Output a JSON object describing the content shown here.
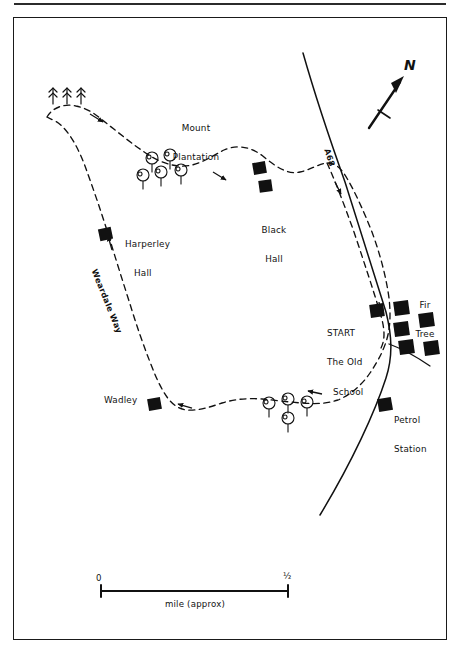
{
  "map": {
    "title": "Weardale Way walking route map",
    "orientation": {
      "label": "N",
      "name": "north-arrow"
    },
    "scale_bar": {
      "start_label": "0",
      "end_label": "½",
      "caption": "mile (approx)"
    },
    "roads": [
      {
        "id": "a68",
        "label": "A68",
        "type": "main-road"
      },
      {
        "id": "side-road",
        "label": "",
        "type": "minor-road"
      }
    ],
    "route": {
      "name": "Weardale Way",
      "path_label": "Weardale Way",
      "style": "dashed",
      "direction_markers": 6
    },
    "start_point": {
      "line1": "START",
      "line2": "The Old",
      "line3": "School"
    },
    "places": [
      {
        "id": "mount-plantation",
        "label_line1": "Mount",
        "label_line2": "Plantation",
        "kind": "woodland"
      },
      {
        "id": "black-hall",
        "label_line1": "Black",
        "label_line2": "Hall",
        "kind": "building"
      },
      {
        "id": "harperley-hall",
        "label_line1": "Harperley",
        "label_line2": "Hall",
        "kind": "building"
      },
      {
        "id": "wadley",
        "label_line1": "Wadley",
        "label_line2": "",
        "kind": "building"
      },
      {
        "id": "fir-tree",
        "label_line1": "Fir",
        "label_line2": "Tree",
        "kind": "settlement"
      },
      {
        "id": "petrol-station",
        "label_line1": "Petrol",
        "label_line2": "Station",
        "kind": "building"
      }
    ],
    "symbols": {
      "conifer_count": 3,
      "deciduous_upper_count": 5,
      "deciduous_lower_count": 4,
      "building_squares_total": 12
    },
    "colors": {
      "ink": "#111111",
      "paper": "#ffffff",
      "frame": "#1a1a1a"
    }
  }
}
